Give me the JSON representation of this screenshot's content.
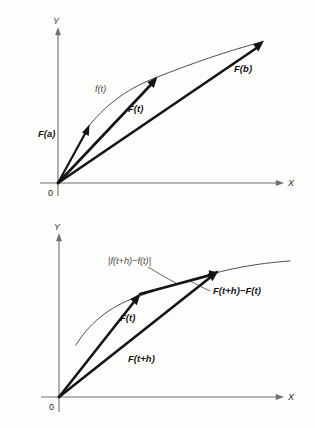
{
  "figure": {
    "background_color": "#fdfdfc",
    "ink_color": "#141414",
    "axis_color": "#6f6f6f",
    "curve_color": "#30302e",
    "panels": [
      {
        "id": "upper",
        "name": "position-vector-diagram",
        "axes": {
          "x_label": "X",
          "y_label": "Y",
          "origin_label": "0"
        },
        "curve_label": "f(t)",
        "vectors": [
          {
            "name": "F-of-a",
            "label": "F(a)"
          },
          {
            "name": "F-of-t",
            "label": "F(t)"
          },
          {
            "name": "F-of-b",
            "label": "F(b)"
          }
        ]
      },
      {
        "id": "lower",
        "name": "difference-vector-diagram",
        "axes": {
          "x_label": "X",
          "y_label": "Y",
          "origin_label": "0"
        },
        "arc_length_label": "|f(t+h)−f(t)|",
        "vectors": [
          {
            "name": "F-of-t",
            "label": "F(t)"
          },
          {
            "name": "F-of-t-plus-h",
            "label": "F(t+h)"
          },
          {
            "name": "F-difference",
            "label": "F(t+h)−F(t)"
          }
        ]
      }
    ]
  }
}
